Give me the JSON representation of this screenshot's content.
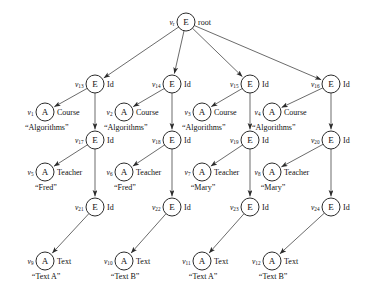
{
  "diagram": {
    "node_glyphs": {
      "element": "E",
      "attribute": "A"
    },
    "colors": {
      "stroke": "#2b2b2b",
      "text": "#111111",
      "background": "#ffffff"
    },
    "nodes": [
      {
        "id": "vr",
        "vlabel": "v",
        "sub": "r",
        "glyph": "E",
        "tag": "root",
        "value": "",
        "x": 186,
        "y": 22,
        "row": 0
      },
      {
        "id": "v13",
        "vlabel": "v",
        "sub": "13",
        "glyph": "E",
        "tag": "Id",
        "value": "",
        "x": 95,
        "y": 84,
        "row": 1
      },
      {
        "id": "v14",
        "vlabel": "v",
        "sub": "14",
        "glyph": "E",
        "tag": "Id",
        "value": "",
        "x": 172,
        "y": 84,
        "row": 1
      },
      {
        "id": "v15",
        "vlabel": "v",
        "sub": "15",
        "glyph": "E",
        "tag": "Id",
        "value": "",
        "x": 250,
        "y": 84,
        "row": 1
      },
      {
        "id": "v16",
        "vlabel": "v",
        "sub": "16",
        "glyph": "E",
        "tag": "Id",
        "value": "",
        "x": 331,
        "y": 84,
        "row": 1
      },
      {
        "id": "v1",
        "vlabel": "v",
        "sub": "1",
        "glyph": "A",
        "tag": "Course",
        "value": "“Algorithms”",
        "x": 45,
        "y": 112,
        "row": 2
      },
      {
        "id": "v2",
        "vlabel": "v",
        "sub": "2",
        "glyph": "A",
        "tag": "Course",
        "value": "“Algorithms”",
        "x": 124,
        "y": 112,
        "row": 2
      },
      {
        "id": "v3",
        "vlabel": "v",
        "sub": "3",
        "glyph": "A",
        "tag": "Course",
        "value": "“Algorithms”",
        "x": 202,
        "y": 112,
        "row": 2
      },
      {
        "id": "v4",
        "vlabel": "v",
        "sub": "4",
        "glyph": "A",
        "tag": "Course",
        "value": "“Algorithms”",
        "x": 272,
        "y": 112,
        "row": 2
      },
      {
        "id": "v17",
        "vlabel": "v",
        "sub": "17",
        "glyph": "E",
        "tag": "Id",
        "value": "",
        "x": 95,
        "y": 140,
        "row": 3
      },
      {
        "id": "v18",
        "vlabel": "v",
        "sub": "18",
        "glyph": "E",
        "tag": "Id",
        "value": "",
        "x": 172,
        "y": 140,
        "row": 3
      },
      {
        "id": "v19",
        "vlabel": "v",
        "sub": "19",
        "glyph": "E",
        "tag": "Id",
        "value": "",
        "x": 250,
        "y": 140,
        "row": 3
      },
      {
        "id": "v20",
        "vlabel": "v",
        "sub": "20",
        "glyph": "E",
        "tag": "Id",
        "value": "",
        "x": 331,
        "y": 140,
        "row": 3
      },
      {
        "id": "v5",
        "vlabel": "v",
        "sub": "5",
        "glyph": "A",
        "tag": "Teacher",
        "value": "“Fred”",
        "x": 45,
        "y": 172,
        "row": 4
      },
      {
        "id": "v6",
        "vlabel": "v",
        "sub": "6",
        "glyph": "A",
        "tag": "Teacher",
        "value": "“Fred”",
        "x": 124,
        "y": 172,
        "row": 4
      },
      {
        "id": "v7",
        "vlabel": "v",
        "sub": "7",
        "glyph": "A",
        "tag": "Teacher",
        "value": "“Mary”",
        "x": 202,
        "y": 172,
        "row": 4
      },
      {
        "id": "v8",
        "vlabel": "v",
        "sub": "8",
        "glyph": "A",
        "tag": "Teacher",
        "value": "“Mary”",
        "x": 272,
        "y": 172,
        "row": 4
      },
      {
        "id": "v21",
        "vlabel": "v",
        "sub": "21",
        "glyph": "E",
        "tag": "Id",
        "value": "",
        "x": 95,
        "y": 207,
        "row": 5
      },
      {
        "id": "v22",
        "vlabel": "v",
        "sub": "22",
        "glyph": "E",
        "tag": "Id",
        "value": "",
        "x": 172,
        "y": 207,
        "row": 5
      },
      {
        "id": "v23",
        "vlabel": "v",
        "sub": "23",
        "glyph": "E",
        "tag": "Id",
        "value": "",
        "x": 250,
        "y": 207,
        "row": 5
      },
      {
        "id": "v24",
        "vlabel": "v",
        "sub": "24",
        "glyph": "E",
        "tag": "Id",
        "value": "",
        "x": 331,
        "y": 207,
        "row": 5
      },
      {
        "id": "v9",
        "vlabel": "v",
        "sub": "9",
        "glyph": "A",
        "tag": "Text",
        "value": "“Text A”",
        "x": 45,
        "y": 261,
        "row": 6
      },
      {
        "id": "v10",
        "vlabel": "v",
        "sub": "10",
        "glyph": "A",
        "tag": "Text",
        "value": "“Text B”",
        "x": 124,
        "y": 261,
        "row": 6
      },
      {
        "id": "v11",
        "vlabel": "v",
        "sub": "11",
        "glyph": "A",
        "tag": "Text",
        "value": "“Text A”",
        "x": 202,
        "y": 261,
        "row": 6
      },
      {
        "id": "v12",
        "vlabel": "v",
        "sub": "12",
        "glyph": "A",
        "tag": "Text",
        "value": "“Text B”",
        "x": 272,
        "y": 261,
        "row": 6
      }
    ],
    "edges": [
      {
        "from": "vr",
        "to": "v13"
      },
      {
        "from": "vr",
        "to": "v14"
      },
      {
        "from": "vr",
        "to": "v15"
      },
      {
        "from": "vr",
        "to": "v16"
      },
      {
        "from": "v13",
        "to": "v1"
      },
      {
        "from": "v14",
        "to": "v2"
      },
      {
        "from": "v15",
        "to": "v3"
      },
      {
        "from": "v16",
        "to": "v4"
      },
      {
        "from": "v13",
        "to": "v17"
      },
      {
        "from": "v14",
        "to": "v18"
      },
      {
        "from": "v15",
        "to": "v19"
      },
      {
        "from": "v16",
        "to": "v20"
      },
      {
        "from": "v17",
        "to": "v5"
      },
      {
        "from": "v18",
        "to": "v6"
      },
      {
        "from": "v19",
        "to": "v7"
      },
      {
        "from": "v20",
        "to": "v8"
      },
      {
        "from": "v17",
        "to": "v21"
      },
      {
        "from": "v18",
        "to": "v22"
      },
      {
        "from": "v19",
        "to": "v23"
      },
      {
        "from": "v20",
        "to": "v24"
      },
      {
        "from": "v21",
        "to": "v9"
      },
      {
        "from": "v22",
        "to": "v10"
      },
      {
        "from": "v23",
        "to": "v11"
      },
      {
        "from": "v24",
        "to": "v12"
      }
    ]
  }
}
